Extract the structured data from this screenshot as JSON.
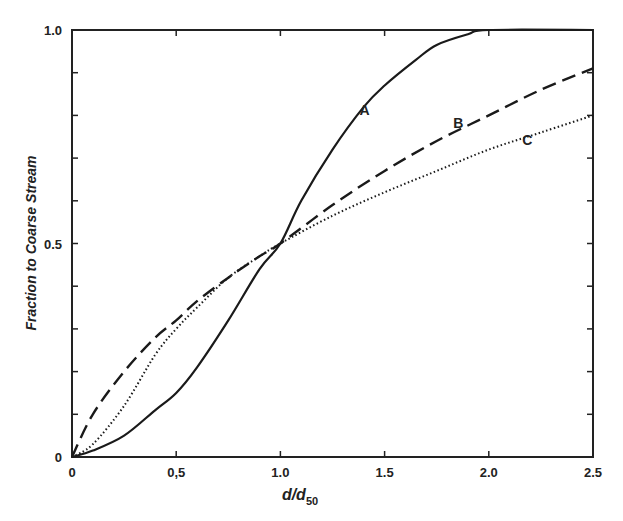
{
  "chart_data": {
    "type": "line",
    "title": "",
    "xlabel": "d/d50",
    "xlabel_main": "d/d",
    "xlabel_sub": "50",
    "ylabel": "Fraction to Coarse Stream",
    "xlim": [
      0,
      2.5
    ],
    "ylim": [
      0,
      1.0
    ],
    "grid": false,
    "legend": "none (curves labeled inline A, B, C)",
    "x_tick_labels": [
      "0",
      "0,5",
      "1.0",
      "1.5",
      "2.0",
      "2.5"
    ],
    "x_ticks": [
      0,
      0.5,
      1.0,
      1.5,
      2.0,
      2.5
    ],
    "y_tick_labels": [
      "0",
      "0.5",
      "1.0"
    ],
    "y_ticks_labeled": [
      0,
      0.5,
      1.0
    ],
    "y_minor_tick_step": 0.1,
    "series": [
      {
        "name": "A",
        "style": "solid",
        "x": [
          0,
          0.1,
          0.25,
          0.4,
          0.5,
          0.6,
          0.75,
          0.9,
          1.0,
          1.1,
          1.25,
          1.4,
          1.5,
          1.65,
          1.75,
          1.9,
          2.0,
          2.5
        ],
        "values": [
          0,
          0.015,
          0.05,
          0.11,
          0.15,
          0.21,
          0.32,
          0.44,
          0.5,
          0.6,
          0.72,
          0.82,
          0.87,
          0.93,
          0.965,
          0.99,
          1.0,
          1.0
        ]
      },
      {
        "name": "B",
        "style": "dashed",
        "x": [
          0,
          0.1,
          0.25,
          0.4,
          0.5,
          0.6,
          0.75,
          0.9,
          1.0,
          1.25,
          1.5,
          1.75,
          2.0,
          2.25,
          2.5
        ],
        "values": [
          0,
          0.1,
          0.2,
          0.28,
          0.32,
          0.365,
          0.42,
          0.47,
          0.5,
          0.59,
          0.67,
          0.74,
          0.8,
          0.86,
          0.91
        ]
      },
      {
        "name": "C",
        "style": "dotted",
        "x": [
          0,
          0.1,
          0.25,
          0.4,
          0.5,
          0.6,
          0.75,
          0.9,
          1.0,
          1.25,
          1.5,
          1.75,
          2.0,
          2.25,
          2.5
        ],
        "values": [
          0,
          0.03,
          0.12,
          0.24,
          0.3,
          0.35,
          0.42,
          0.47,
          0.5,
          0.565,
          0.62,
          0.67,
          0.72,
          0.76,
          0.8
        ]
      }
    ],
    "annotations": [
      {
        "text": "A",
        "x": 1.38,
        "y": 0.8
      },
      {
        "text": "B",
        "x": 1.83,
        "y": 0.77
      },
      {
        "text": "C",
        "x": 2.16,
        "y": 0.73
      }
    ]
  }
}
